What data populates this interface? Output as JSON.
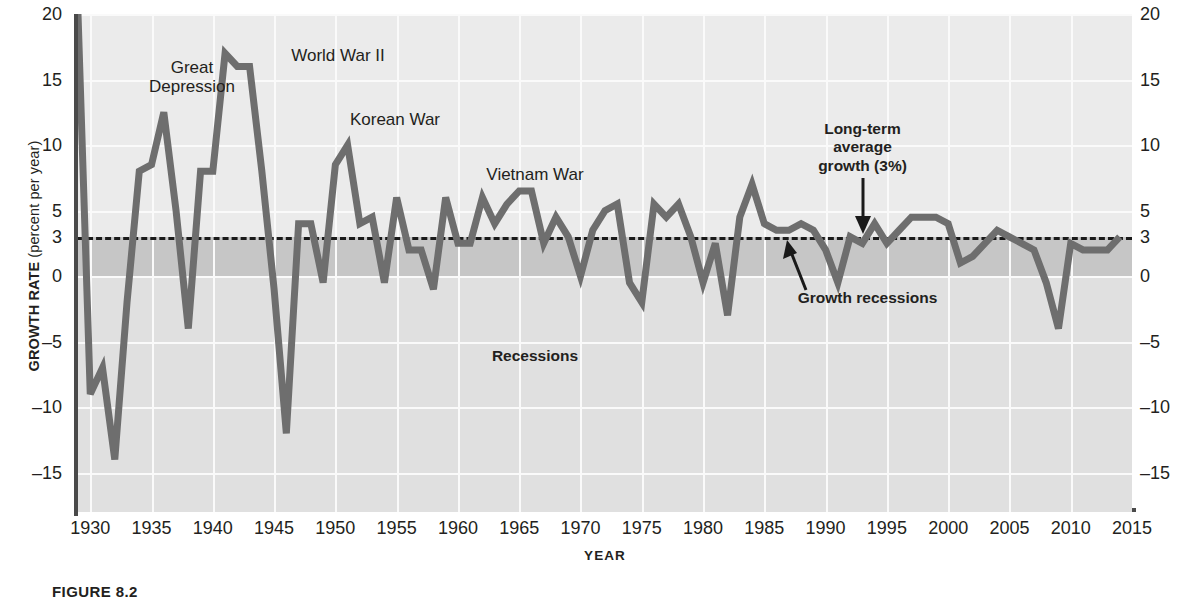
{
  "chart_data": {
    "type": "line",
    "title": "",
    "xlabel": "YEAR",
    "ylabel": "GROWTH RATE",
    "ylabel_unit": "(percent per year)",
    "xlim": [
      1929,
      2015
    ],
    "ylim": [
      -18,
      20
    ],
    "yticks": [
      20,
      15,
      10,
      5,
      3,
      0,
      -5,
      -10,
      -15
    ],
    "ytick_labels": [
      "20",
      "15",
      "10",
      "5",
      "3",
      "0",
      "–5",
      "–10",
      "–15"
    ],
    "xticks": [
      1930,
      1935,
      1940,
      1945,
      1950,
      1955,
      1960,
      1965,
      1970,
      1975,
      1980,
      1985,
      1990,
      1995,
      2000,
      2005,
      2010,
      2015
    ],
    "xtick_labels": [
      "1930",
      "1935",
      "1940",
      "1945",
      "1950",
      "1955",
      "1960",
      "1965",
      "1970",
      "1975",
      "1980",
      "1985",
      "1990",
      "1995",
      "2000",
      "2005",
      "2010",
      "2015"
    ],
    "grid": true,
    "legend": "none",
    "reference_line": {
      "value": 3,
      "style": "dashed",
      "label": "Long-term average growth (3%)"
    },
    "bands": [
      {
        "name": "growth-recession-band",
        "from": 0,
        "to": 3,
        "color": "#c6c6c6",
        "label": "Growth recessions"
      },
      {
        "name": "recession-band",
        "from": -18,
        "to": 0,
        "color": "#e0e0e0",
        "label": "Recessions"
      }
    ],
    "series": [
      {
        "name": "Real GDP growth rate",
        "color": "#6e6e6e",
        "x": [
          1929,
          1930,
          1931,
          1932,
          1933,
          1934,
          1935,
          1936,
          1937,
          1938,
          1939,
          1940,
          1941,
          1942,
          1943,
          1944,
          1945,
          1946,
          1947,
          1948,
          1949,
          1950,
          1951,
          1952,
          1953,
          1954,
          1955,
          1956,
          1957,
          1958,
          1959,
          1960,
          1961,
          1962,
          1963,
          1964,
          1965,
          1966,
          1967,
          1968,
          1969,
          1970,
          1971,
          1972,
          1973,
          1974,
          1975,
          1976,
          1977,
          1978,
          1979,
          1980,
          1981,
          1982,
          1983,
          1984,
          1985,
          1986,
          1987,
          1988,
          1989,
          1990,
          1991,
          1992,
          1993,
          1994,
          1995,
          1996,
          1997,
          1998,
          1999,
          2000,
          2001,
          2002,
          2003,
          2004,
          2005,
          2006,
          2007,
          2008,
          2009,
          2010,
          2011,
          2012,
          2013,
          2014
        ],
        "values": [
          20,
          -9,
          -7,
          -14,
          -2,
          8,
          8.5,
          12.5,
          5,
          -4,
          8,
          8,
          17,
          16,
          16,
          8,
          -1,
          -12,
          4,
          4,
          -0.5,
          8.5,
          10,
          4,
          4.5,
          -0.5,
          6,
          2,
          2,
          -1,
          6,
          2.5,
          2.5,
          6,
          4,
          5.5,
          6.5,
          6.5,
          2.5,
          4.5,
          3,
          0,
          3.5,
          5,
          5.5,
          -0.5,
          -2,
          5.5,
          4.5,
          5.5,
          3,
          -0.5,
          2.5,
          -3,
          4.5,
          7,
          4,
          3.5,
          3.5,
          4,
          3.5,
          2,
          -0.5,
          3,
          2.5,
          4,
          2.5,
          3.5,
          4.5,
          4.5,
          4.5,
          4,
          1,
          1.5,
          2.5,
          3.5,
          3,
          2.5,
          2,
          -0.5,
          -4,
          2.5,
          2,
          2,
          2,
          3
        ]
      }
    ],
    "annotations": [
      {
        "name": "great-depression",
        "text": "Great\nDepression",
        "bold": false
      },
      {
        "name": "world-war-ii",
        "text": "World War II",
        "bold": false
      },
      {
        "name": "korean-war",
        "text": "Korean War",
        "bold": false
      },
      {
        "name": "vietnam-war",
        "text": "Vietnam War",
        "bold": false
      },
      {
        "name": "long-term-average-growth",
        "text": "Long-term\naverage\ngrowth (3%)",
        "bold": true
      },
      {
        "name": "growth-recessions",
        "text": "Growth recessions",
        "bold": true
      },
      {
        "name": "recessions",
        "text": "Recessions",
        "bold": true
      }
    ]
  },
  "axes": {
    "y_title_main": "GROWTH RATE ",
    "y_title_unit": "(percent per year)",
    "x_title": "YEAR"
  },
  "annotations": {
    "great_depression": "Great\nDepression",
    "world_war_ii": "World War II",
    "korean_war": "Korean War",
    "vietnam_war": "Vietnam War",
    "long_term_average": "Long-term\naverage\ngrowth (3%)",
    "growth_recessions": "Growth recessions",
    "recessions": "Recessions"
  },
  "caption": {
    "label": "FIGURE 8.2"
  },
  "colors": {
    "series": "#6e6e6e",
    "plot_background": "#ebebeb",
    "growth_recession_band": "#c6c6c6",
    "recession_band": "#e0e0e0",
    "axis": "#4a4a4a",
    "text": "#231f20"
  }
}
